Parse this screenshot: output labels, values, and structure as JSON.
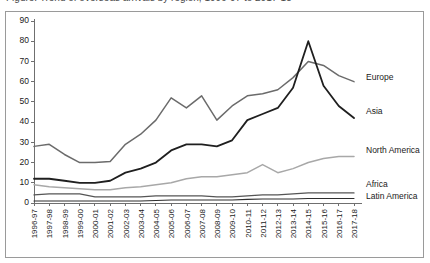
{
  "figure": {
    "caption_partial": "Figure: Trend of overseas arrivals by region, 1996-97 to 2017-18"
  },
  "chart_data": {
    "type": "line",
    "title": "",
    "xlabel": "",
    "ylabel": "",
    "ylim": [
      0,
      90
    ],
    "ytick_step": 10,
    "yticks": [
      0,
      10,
      20,
      30,
      40,
      50,
      60,
      70,
      80,
      90
    ],
    "grid": false,
    "legend_position": "right-inline",
    "categories": [
      "1996-97",
      "1997-98",
      "1998-99",
      "1999-00",
      "2000-01",
      "2001-02",
      "2002-03",
      "2003-04",
      "2004-05",
      "2005-06",
      "2006-07",
      "2007-08",
      "2008-09",
      "2009-10",
      "2010-11",
      "2011-12",
      "2012-13",
      "2013-14",
      "2014-15",
      "2015-16",
      "2016-17",
      "2017-18"
    ],
    "series": [
      {
        "name": "Europe",
        "color": "#6b6b6b",
        "width": 1.5,
        "label_y": 62,
        "values": [
          28,
          29,
          24,
          20,
          20,
          20.5,
          29,
          34,
          41,
          52,
          47,
          53,
          41,
          48,
          53,
          54,
          56,
          62,
          70,
          68,
          63,
          60
        ]
      },
      {
        "name": "Asia",
        "color": "#1f1f1f",
        "width": 1.8,
        "label_y": 45,
        "values": [
          12,
          12,
          11,
          10,
          10,
          11,
          15,
          17,
          20,
          26,
          29,
          29,
          28,
          31,
          41,
          44,
          47,
          57,
          80,
          58,
          48,
          42
        ]
      },
      {
        "name": "North America",
        "color": "#a8a8a8",
        "width": 1.5,
        "label_y": 26,
        "values": [
          9,
          8,
          7.5,
          7,
          6.5,
          6.5,
          7.5,
          8,
          9,
          10,
          12,
          13,
          13,
          14,
          15,
          19,
          15,
          17,
          20,
          22,
          23,
          23
        ]
      },
      {
        "name": "Africa",
        "color": "#555555",
        "width": 1.3,
        "label_y": 9,
        "values": [
          4,
          4.5,
          4.5,
          4.5,
          3,
          3,
          3,
          3,
          3.5,
          3.5,
          3.5,
          3.5,
          3,
          3,
          3.5,
          4,
          4,
          4.5,
          5,
          5,
          5,
          5
        ]
      },
      {
        "name": "Latin America",
        "color": "#2e2e2e",
        "width": 1.1,
        "label_y": 3,
        "values": [
          1,
          1,
          1,
          1,
          1,
          1,
          1,
          1,
          1.2,
          1.5,
          1.5,
          1.5,
          1.5,
          1.5,
          1.8,
          2,
          2,
          2,
          2.2,
          2.2,
          2.2,
          2.2
        ]
      }
    ]
  }
}
